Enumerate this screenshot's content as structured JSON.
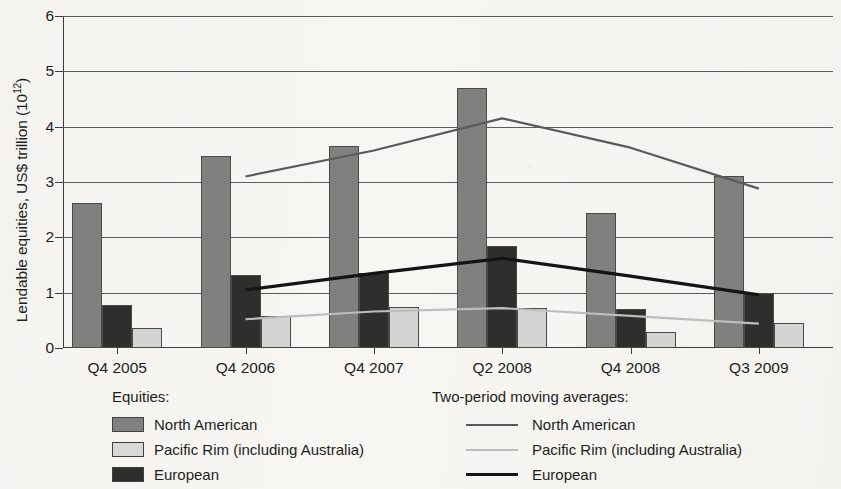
{
  "chart_data": {
    "type": "bar",
    "title": "",
    "xlabel": "",
    "ylabel": "Lendable equities, US$ trillion (10",
    "ylabel_exponent": "12",
    "ylabel_suffix": ")",
    "ylim": [
      0,
      6
    ],
    "yticks": [
      0,
      1,
      2,
      3,
      4,
      5,
      6
    ],
    "ytick_labels": [
      "0",
      "1",
      "2",
      "3",
      "4",
      "5",
      "6"
    ],
    "grid": true,
    "legend_position": "below",
    "categories": [
      "Q4 2005",
      "Q4 2006",
      "Q4 2007",
      "Q2 2008",
      "Q4 2008",
      "Q3 2009"
    ],
    "series": [
      {
        "name": "North American",
        "kind": "bar",
        "color": "#808080",
        "values": [
          2.62,
          3.47,
          3.65,
          4.7,
          2.44,
          3.11
        ]
      },
      {
        "name": "European",
        "kind": "bar",
        "color": "#2e2e2e",
        "values": [
          0.78,
          1.32,
          1.35,
          1.85,
          0.7,
          1.0
        ]
      },
      {
        "name": "Pacific Rim (including Australia)",
        "kind": "bar",
        "color": "#d4d4d4",
        "values": [
          0.37,
          0.58,
          0.74,
          0.72,
          0.29,
          0.45
        ]
      },
      {
        "name": "North American",
        "kind": "line",
        "color": "#5a5a5a",
        "values": [
          null,
          3.1,
          3.57,
          4.15,
          3.62,
          2.88
        ]
      },
      {
        "name": "Pacific Rim (including Australia)",
        "kind": "line",
        "color": "#bdbdbd",
        "values": [
          null,
          0.52,
          0.66,
          0.72,
          0.58,
          0.44
        ]
      },
      {
        "name": "European",
        "kind": "line",
        "color": "#141414",
        "values": [
          null,
          1.05,
          1.35,
          1.62,
          1.3,
          0.96
        ]
      }
    ],
    "legends": [
      {
        "id": "bars",
        "title": "Equities:",
        "marker": "swatch",
        "entries": [
          {
            "label": "North American",
            "color": "#808080"
          },
          {
            "label": "Pacific Rim (including Australia)",
            "color": "#d9d9d9"
          },
          {
            "label": "European",
            "color": "#2e2e2e"
          }
        ]
      },
      {
        "id": "lines",
        "title": "Two-period moving averages:",
        "marker": "line",
        "entries": [
          {
            "label": "North American",
            "color": "#5a5a5a",
            "width": 2
          },
          {
            "label": "Pacific Rim (including Australia)",
            "color": "#bdbdbd",
            "width": 2
          },
          {
            "label": "European",
            "color": "#141414",
            "width": 3
          }
        ]
      }
    ]
  }
}
